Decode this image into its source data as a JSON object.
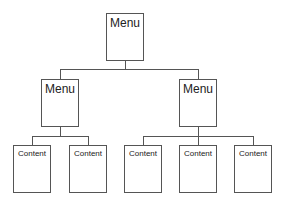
{
  "diagram": {
    "type": "hierarchy-tree",
    "root": {
      "label": "Menu",
      "children": [
        {
          "label": "Menu",
          "children": [
            {
              "label": "Content"
            },
            {
              "label": "Content"
            }
          ]
        },
        {
          "label": "Menu",
          "children": [
            {
              "label": "Content"
            },
            {
              "label": "Content"
            },
            {
              "label": "Content"
            }
          ]
        }
      ]
    }
  },
  "nodes": {
    "root": "Menu",
    "menu_left": "Menu",
    "menu_right": "Menu",
    "content_1": "Content",
    "content_2": "Content",
    "content_3": "Content",
    "content_4": "Content",
    "content_5": "Content"
  },
  "colors": {
    "stroke": "#555555",
    "background": "#ffffff",
    "text": "#222222"
  }
}
